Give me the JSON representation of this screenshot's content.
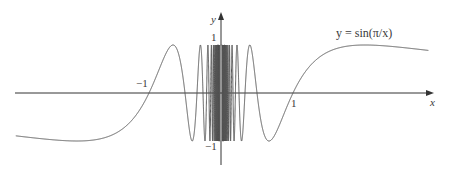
{
  "chart_data": {
    "type": "line",
    "title": "",
    "function": "y = sin(pi/x)",
    "annotation": "y = sin(π/x)",
    "xlabel": "x",
    "ylabel": "y",
    "xlim": [
      -2.85,
      2.95
    ],
    "ylim": [
      -1.15,
      1.2
    ],
    "x_ticks": [
      {
        "value": -1,
        "label": "−1"
      },
      {
        "value": 1,
        "label": "1"
      }
    ],
    "y_ticks": [
      {
        "value": 1,
        "label": "1"
      },
      {
        "value": -1,
        "label": "−1"
      }
    ],
    "grid": false,
    "legend": null,
    "series": [
      {
        "name": "y = sin(π/x)",
        "domain_left": [
          -2.85,
          -0.02
        ],
        "domain_right": [
          0.02,
          2.88
        ]
      }
    ],
    "sample_points": [
      {
        "x": -2.85,
        "y": -0.89
      },
      {
        "x": -2.0,
        "y": -1.0
      },
      {
        "x": -1.0,
        "y": 0.0
      },
      {
        "x": -0.667,
        "y": 1.0
      },
      {
        "x": -0.4,
        "y": -1.0
      },
      {
        "x": 0.4,
        "y": 1.0
      },
      {
        "x": 0.667,
        "y": -1.0
      },
      {
        "x": 1.0,
        "y": 0.0
      },
      {
        "x": 2.0,
        "y": 1.0
      },
      {
        "x": 2.88,
        "y": 0.885
      }
    ],
    "colors": {
      "curve": "#555555",
      "axes": "#333333",
      "text": "#3a3a3a"
    }
  },
  "labels": {
    "function_label": "y = sin(π/x)",
    "x_axis": "x",
    "y_axis": "y",
    "x_tick_neg1": "−1",
    "x_tick_1": "1",
    "y_tick_1": "1",
    "y_tick_neg1": "−1"
  }
}
